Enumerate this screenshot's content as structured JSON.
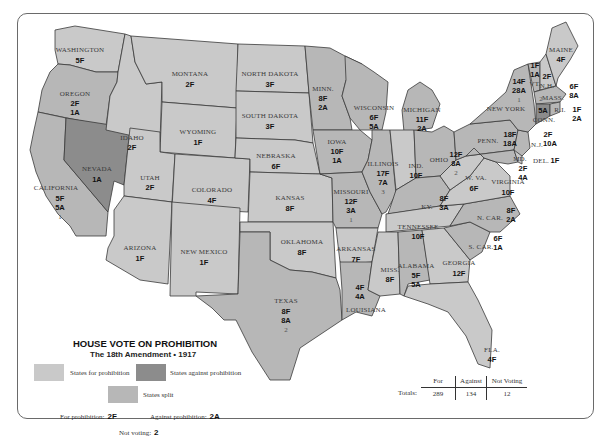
{
  "title": "HOUSE VOTE ON PROHIBITION",
  "subtitle": "The 18th Amendment • 1917",
  "legend": {
    "for_label": "States for prohibition",
    "against_label": "States against prohibition",
    "split_label": "States split",
    "for_note_label": "For prohibition:",
    "for_note_value": "2F",
    "against_note_label": "Against prohibition:",
    "against_note_value": "2A",
    "notvoting_note_label": "Not voting:",
    "notvoting_note_value": "2",
    "colors": {
      "for": "#c9c9c9",
      "against": "#8c8c8c",
      "split": "#b7b7b7"
    }
  },
  "totals": {
    "label": "Totals:",
    "headers": [
      "For",
      "Against",
      "Not Voting"
    ],
    "values": [
      "289",
      "134",
      "12"
    ]
  },
  "states": {
    "washington": {
      "name": "WASHINGTON",
      "f": "5F"
    },
    "oregon": {
      "name": "OREGON",
      "f": "2F",
      "a": "1A"
    },
    "california": {
      "name": "CALIFORNIA",
      "f": "5F",
      "a": "5A",
      "nv": "1"
    },
    "nevada": {
      "name": "NEVADA",
      "a": "1A"
    },
    "idaho": {
      "name": "IDAHO",
      "f": "2F"
    },
    "montana": {
      "name": "MONTANA",
      "f": "2F"
    },
    "wyoming": {
      "name": "WYOMING",
      "f": "1F"
    },
    "utah": {
      "name": "UTAH",
      "f": "2F"
    },
    "colorado": {
      "name": "COLORADO",
      "f": "4F"
    },
    "arizona": {
      "name": "ARIZONA",
      "f": "1F"
    },
    "new_mexico": {
      "name": "NEW MEXICO",
      "f": "1F"
    },
    "north_dakota": {
      "name": "NORTH DAKOTA",
      "f": "3F"
    },
    "south_dakota": {
      "name": "SOUTH DAKOTA",
      "f": "3F"
    },
    "nebraska": {
      "name": "NEBRASKA",
      "f": "6F"
    },
    "kansas": {
      "name": "KANSAS",
      "f": "8F"
    },
    "oklahoma": {
      "name": "OKLAHOMA",
      "f": "8F"
    },
    "texas": {
      "name": "TEXAS",
      "f": "8F",
      "a": "8A",
      "nv": "2"
    },
    "minnesota": {
      "name": "MINN.",
      "f": "8F",
      "a": "2A"
    },
    "iowa": {
      "name": "IOWA",
      "f": "10F",
      "a": "1A"
    },
    "missouri": {
      "name": "MISSOURI",
      "f": "12F",
      "a": "3A",
      "nv": "1"
    },
    "arkansas": {
      "name": "ARKANSAS",
      "f": "7F"
    },
    "louisiana": {
      "name": "LOUISIANA",
      "f": "4F",
      "a": "4A"
    },
    "wisconsin": {
      "name": "WISCONSIN",
      "f": "6F",
      "a": "5A"
    },
    "illinois": {
      "name": "ILLINOIS",
      "f": "17F",
      "a": "7A",
      "nv": "3"
    },
    "michigan": {
      "name": "MICHIGAN",
      "f": "11F",
      "a": "2A"
    },
    "indiana": {
      "name": "IND.",
      "f": "10F"
    },
    "ohio": {
      "name": "OHIO",
      "f": "12F",
      "a": "8A",
      "nv": "2"
    },
    "kentucky": {
      "name": "KY.",
      "f": "8F",
      "a": "3A"
    },
    "tennessee": {
      "name": "TENNESSEE",
      "f": "10F"
    },
    "mississippi": {
      "name": "MISS.",
      "f": "8F"
    },
    "alabama": {
      "name": "ALABAMA",
      "f": "5F",
      "a": "5A"
    },
    "georgia": {
      "name": "GEORGIA",
      "f": "12F"
    },
    "florida": {
      "name": "FLA.",
      "f": "4F"
    },
    "south_carolina": {
      "name": "S. CAR.",
      "f": "6F",
      "a": "1A"
    },
    "north_carolina": {
      "name": "N. CAR.",
      "f": "8F",
      "a": "2A"
    },
    "virginia": {
      "name": "VIRGINIA",
      "f": "10F"
    },
    "west_virginia": {
      "name": "W. VA.",
      "f": "6F"
    },
    "maryland": {
      "name": "MD.",
      "f": "2F",
      "a": "4A"
    },
    "delaware": {
      "name": "DEL.",
      "f": "1F"
    },
    "pennsylvania": {
      "name": "PENN.",
      "f": "18F",
      "a": "18A"
    },
    "new_jersey": {
      "name": "N.J.",
      "f": "2F",
      "a": "10A"
    },
    "new_york": {
      "name": "NEW YORK",
      "f": "14F",
      "a": "28A",
      "nv": "1"
    },
    "vermont": {
      "name": "VT.",
      "f": "1F",
      "a": "1A"
    },
    "new_hampshire": {
      "name": "N.H.",
      "f": "2F"
    },
    "maine": {
      "name": "MAINE",
      "f": "4F"
    },
    "massachusetts": {
      "name": "MASS.",
      "f": "6F",
      "a": "8A",
      "nv": "2"
    },
    "rhode_island": {
      "name": "R.I.",
      "f": "1F",
      "a": "2A"
    },
    "connecticut": {
      "name": "CONN.",
      "a": "5A"
    }
  }
}
